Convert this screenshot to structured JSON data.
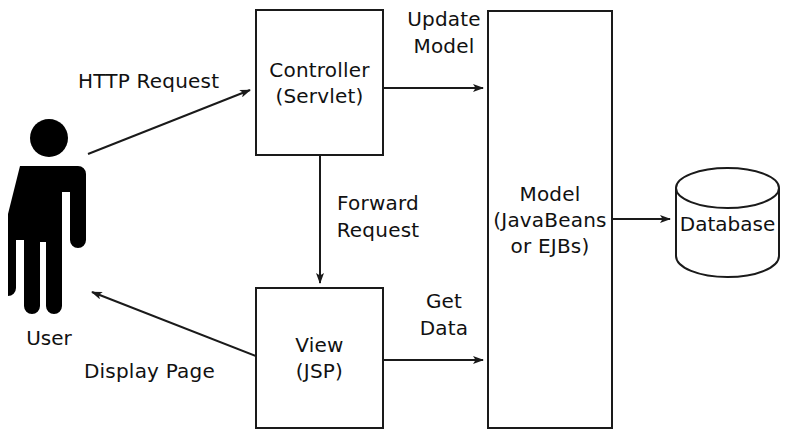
{
  "diagram": {
    "nodes": {
      "user": {
        "label": "User",
        "icon": "person-icon"
      },
      "controller": {
        "line1": "Controller",
        "line2": "(Servlet)"
      },
      "view": {
        "line1": "View",
        "line2": "(JSP)"
      },
      "model": {
        "line1": "Model",
        "line2": "(JavaBeans",
        "line3": "or EJBs)"
      },
      "database": {
        "label": "Database",
        "icon": "cylinder-icon"
      }
    },
    "edges": {
      "http_request": {
        "line1": "HTTP Request"
      },
      "update_model": {
        "line1": "Update",
        "line2": "Model"
      },
      "forward_request": {
        "line1": "Forward",
        "line2": "Request"
      },
      "get_data": {
        "line1": "Get",
        "line2": "Data"
      },
      "display_page": {
        "line1": "Display Page"
      }
    },
    "colors": {
      "stroke": "#1a1a1a",
      "text": "#111111",
      "background": "#ffffff",
      "figure_fill": "#000000"
    }
  }
}
